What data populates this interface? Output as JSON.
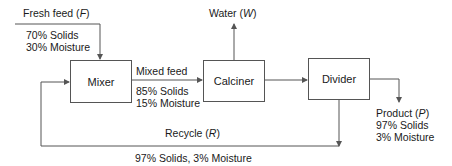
{
  "units": {
    "mixer": "Mixer",
    "calciner": "Calciner",
    "divider": "Divider"
  },
  "streams": {
    "fresh_feed": {
      "name": "Fresh feed",
      "symbol": "F",
      "line1": "70% Solids",
      "line2": "30% Moisture"
    },
    "water": {
      "name": "Water",
      "symbol": "W"
    },
    "mixed_feed": {
      "name": "Mixed feed",
      "line1": "85% Solids",
      "line2": "15% Moisture"
    },
    "product": {
      "name": "Product",
      "symbol": "P",
      "line1": "97% Solids",
      "line2": "3% Moisture"
    },
    "recycle": {
      "name": "Recycle",
      "symbol": "R",
      "composition": "97% Solids, 3% Moisture"
    }
  },
  "colors": {
    "line": "#555555",
    "text": "#1a1a1a"
  }
}
